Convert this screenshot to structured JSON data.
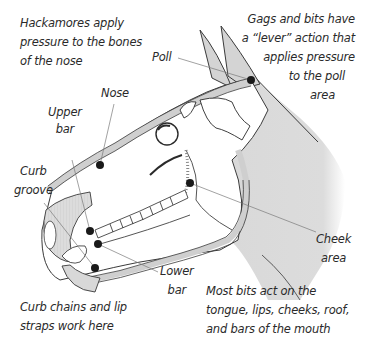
{
  "diagram": {
    "colors": {
      "shading": "#d6d6d6",
      "outline": "#3a3a3a",
      "dot": "#1a1a1a",
      "leader": "#7a7a7a",
      "text": "#2a2a2a"
    },
    "notes": {
      "hackamore": [
        "Hackamores apply",
        "pressure to the bones",
        "of the nose"
      ],
      "gags": [
        "Gags and bits have",
        "a “lever” action that",
        "applies pressure",
        "to the poll",
        "area"
      ],
      "curb_chains": [
        "Curb chains and lip",
        "straps work here"
      ],
      "most_bits": [
        "Most bits act on the",
        "tongue, lips, cheeks, roof,",
        "and bars of the mouth"
      ]
    },
    "labels": {
      "poll": "Poll",
      "nose": "Nose",
      "upper_bar": [
        "Upper",
        "bar"
      ],
      "curb_groove": [
        "Curb",
        "groove"
      ],
      "cheek_area": [
        "Cheek",
        "area"
      ],
      "lower_bar": [
        "Lower",
        "bar"
      ]
    },
    "pressure_points": [
      {
        "name": "poll",
        "x": 251,
        "y": 80
      },
      {
        "name": "nose",
        "x": 100,
        "y": 165
      },
      {
        "name": "cheek",
        "x": 190,
        "y": 183
      },
      {
        "name": "upper-bar",
        "x": 90,
        "y": 231
      },
      {
        "name": "lower-bar",
        "x": 98,
        "y": 244
      },
      {
        "name": "curb-groove",
        "x": 95,
        "y": 268
      }
    ]
  }
}
